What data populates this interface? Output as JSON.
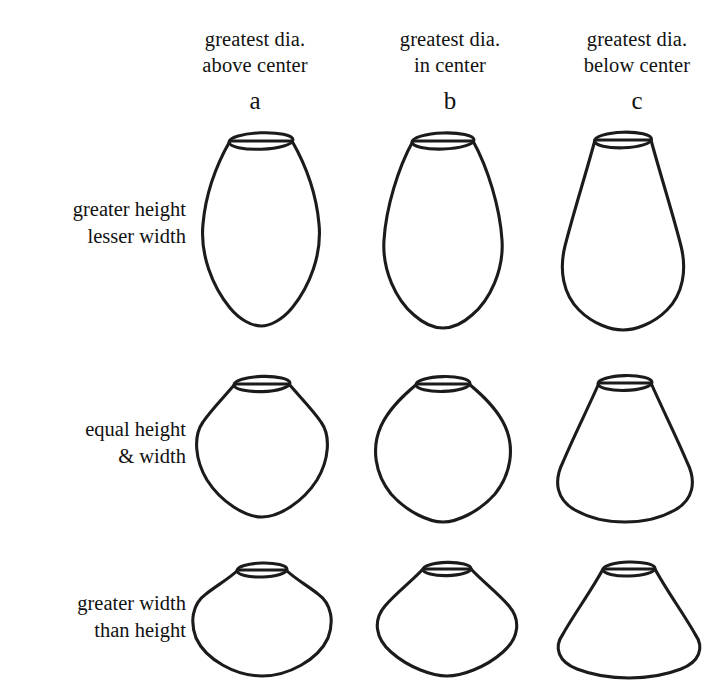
{
  "figure": {
    "line_color": "#1b1b1b",
    "background_color": "#ffffff"
  },
  "columns": [
    {
      "key": "a",
      "letter": "a",
      "header_line1": "greatest dia.",
      "header_line2": "above center"
    },
    {
      "key": "b",
      "letter": "b",
      "header_line1": "greatest dia.",
      "header_line2": "in center"
    },
    {
      "key": "c",
      "letter": "c",
      "header_line1": "greatest dia.",
      "header_line2": "below center"
    }
  ],
  "rows": [
    {
      "key": "r1",
      "label_line1": "greater height",
      "label_line2": "lesser width"
    },
    {
      "key": "r2",
      "label_line1": "equal height",
      "label_line2": "& width"
    },
    {
      "key": "r3",
      "label_line1": "greater width",
      "label_line2": "than height"
    }
  ],
  "vessels": [
    {
      "id": "1a",
      "row": "r1",
      "column": "a",
      "description": "tall narrow jar, greatest diameter above center, rounded shoulder, tapering pointed base"
    },
    {
      "id": "1b",
      "row": "r1",
      "column": "b",
      "description": "tall ovoid jar, greatest diameter at mid-height, symmetrical lens profile"
    },
    {
      "id": "1c",
      "row": "r1",
      "column": "c",
      "description": "tall pear-shaped jar, greatest diameter below center, sloping upper body"
    },
    {
      "id": "2a",
      "row": "r2",
      "column": "a",
      "description": "globular jar of equal height and width, greatest diameter above center, carinated shoulder"
    },
    {
      "id": "2b",
      "row": "r2",
      "column": "b",
      "description": "round jar of equal height and width, greatest diameter at mid-height, pointed base"
    },
    {
      "id": "2c",
      "row": "r2",
      "column": "c",
      "description": "conical jar of equal height and width, greatest diameter below center, straight flaring walls"
    },
    {
      "id": "3a",
      "row": "r3",
      "column": "a",
      "description": "squat wide bowl, greatest diameter above center, broad rounded body"
    },
    {
      "id": "3b",
      "row": "r3",
      "column": "b",
      "description": "squat wide bowl, greatest diameter at mid-height, angular carination"
    },
    {
      "id": "3c",
      "row": "r3",
      "column": "c",
      "description": "low conical bowl, greatest diameter below center, straight flaring walls"
    }
  ]
}
